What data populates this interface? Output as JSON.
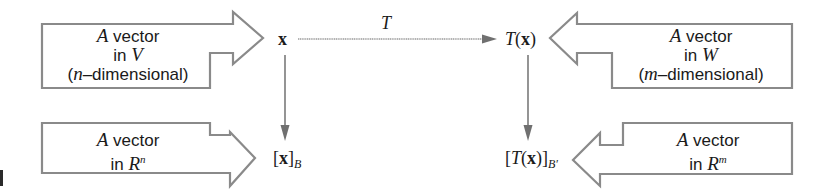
{
  "diagram": {
    "type": "commutative-diagram",
    "nodes": {
      "x": {
        "symbol": "x",
        "position": "top-left"
      },
      "Tx": {
        "prefix": "T",
        "open": "(",
        "symbol": "x",
        "close": ")",
        "position": "top-right"
      },
      "xB": {
        "open": "[",
        "symbol": "x",
        "close": "]",
        "subscript": "B",
        "position": "bottom-left"
      },
      "TxB": {
        "open": "[",
        "prefix": "T",
        "paren_open": "(",
        "symbol": "x",
        "paren_close": ")",
        "close": "]",
        "subscript": "B′",
        "position": "bottom-right"
      }
    },
    "edges": [
      {
        "from": "x",
        "to": "Tx",
        "label": "T",
        "direction": "horizontal"
      },
      {
        "from": "x",
        "to": "xB",
        "label": "",
        "direction": "vertical"
      },
      {
        "from": "Tx",
        "to": "TxB",
        "label": "",
        "direction": "vertical"
      }
    ],
    "callouts": {
      "top_left": {
        "line1_var": "A",
        "line1_text": " vector",
        "line2_text": "in ",
        "line2_var": "V",
        "line3_open": "(",
        "line3_var": "n",
        "line3_text": "–dimensional)",
        "points_to": "x"
      },
      "top_right": {
        "line1_var": "A",
        "line1_text": " vector",
        "line2_text": "in ",
        "line2_var": "W",
        "line3_open": "(",
        "line3_var": "m",
        "line3_text": "–dimensional)",
        "points_to": "T(x)"
      },
      "bottom_left": {
        "line1_var": "A",
        "line1_text": " vector",
        "line2_text": "in ",
        "line2_var": "R",
        "line2_sup": "n",
        "points_to": "[x]_B"
      },
      "bottom_right": {
        "line1_var": "A",
        "line1_text": " vector",
        "line2_text": "in ",
        "line2_var": "R",
        "line2_sup": "m",
        "points_to": "[T(x)]_B'"
      }
    },
    "colors": {
      "outline": "#8a8a8a",
      "arrow": "#707070",
      "text": "#1a1a1a",
      "background": "#ffffff"
    }
  }
}
